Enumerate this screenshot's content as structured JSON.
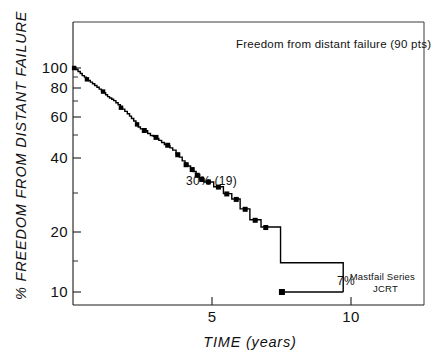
{
  "chart_data": {
    "type": "line",
    "title": "Freedom from distant failure (90 pts)",
    "xlabel": "TIME (years)",
    "ylabel": "% FREEDOM FROM DISTANT FAILURE",
    "xlim": [
      0,
      12.6
    ],
    "ylim": [
      8.2,
      125
    ],
    "yscale": "log",
    "grid": false,
    "legend": null,
    "xticks": [
      5,
      10
    ],
    "xtick_labels": [
      "5",
      "10"
    ],
    "yticks": [
      10,
      20,
      40,
      60,
      80,
      100
    ],
    "ytick_labels": [
      "10",
      "20",
      "40",
      "60",
      "80",
      "100"
    ],
    "yminor_ticks": [
      15,
      30,
      50,
      70,
      90
    ],
    "annotations": [
      {
        "text": "Freedom from distant failure (90 pts)",
        "x": 5.9,
        "y": 112
      },
      {
        "text": "30% (19)",
        "x": 4.95,
        "y": 33.5
      },
      {
        "text": "7%",
        "x": 9.45,
        "y": 10.6
      },
      {
        "text": "Mastfail Series",
        "x": 11.4,
        "y": 11.2
      },
      {
        "text": "JCRT",
        "x": 11.4,
        "y": 10.0
      }
    ],
    "series": [
      {
        "name": "Freedom from distant failure",
        "n_patients": 90,
        "curve_type": "kaplan-meier-step",
        "x": [
          0.0,
          0.1,
          0.18,
          0.26,
          0.33,
          0.41,
          0.48,
          0.55,
          0.62,
          0.7,
          0.78,
          0.86,
          0.94,
          1.02,
          1.1,
          1.17,
          1.24,
          1.31,
          1.39,
          1.46,
          1.54,
          1.62,
          1.7,
          1.78,
          1.86,
          1.95,
          2.03,
          2.1,
          2.18,
          2.26,
          2.34,
          2.42,
          2.5,
          2.58,
          2.68,
          2.78,
          2.88,
          2.98,
          3.08,
          3.18,
          3.28,
          3.38,
          3.48,
          3.58,
          3.7,
          3.82,
          3.92,
          4.02,
          4.12,
          4.22,
          4.32,
          4.42,
          4.55,
          4.7,
          5.05,
          5.4,
          5.7,
          6.0,
          6.35,
          6.75,
          7.45,
          9.7
        ],
        "y": [
          100.0,
          98.5,
          96.5,
          94.5,
          92.5,
          91.0,
          89.5,
          88.0,
          86.5,
          85.0,
          83.5,
          82.0,
          80.5,
          79.0,
          77.5,
          76.0,
          74.5,
          73.5,
          72.5,
          71.5,
          70.0,
          68.5,
          67.0,
          65.5,
          64.0,
          62.5,
          61.0,
          59.5,
          58.0,
          56.5,
          54.5,
          53.5,
          53.0,
          52.5,
          51.0,
          50.0,
          49.5,
          48.5,
          47.5,
          46.5,
          45.5,
          45.0,
          44.0,
          43.0,
          41.5,
          40.0,
          38.5,
          37.5,
          36.5,
          35.5,
          34.5,
          33.5,
          32.0,
          31.0,
          29.5,
          27.5,
          26.0,
          23.5,
          21.0,
          19.5,
          13.5,
          10.0
        ],
        "censor_marker": "square",
        "censor_points": [
          {
            "x": 0.04,
            "y": 100.0
          },
          {
            "x": 0.5,
            "y": 89.0
          },
          {
            "x": 1.08,
            "y": 78.5
          },
          {
            "x": 1.72,
            "y": 66.5
          },
          {
            "x": 2.3,
            "y": 56.0
          },
          {
            "x": 2.56,
            "y": 52.6
          },
          {
            "x": 2.98,
            "y": 49.0
          },
          {
            "x": 3.4,
            "y": 45.2
          },
          {
            "x": 3.76,
            "y": 41.0
          },
          {
            "x": 4.06,
            "y": 37.0
          },
          {
            "x": 4.28,
            "y": 35.2
          },
          {
            "x": 4.46,
            "y": 33.2
          },
          {
            "x": 4.62,
            "y": 31.8
          },
          {
            "x": 4.86,
            "y": 31.0
          },
          {
            "x": 5.22,
            "y": 29.4
          },
          {
            "x": 5.52,
            "y": 27.4
          },
          {
            "x": 5.86,
            "y": 25.9
          },
          {
            "x": 6.18,
            "y": 23.4
          },
          {
            "x": 6.54,
            "y": 20.9
          },
          {
            "x": 6.92,
            "y": 19.4
          },
          {
            "x": 7.5,
            "y": 10.0
          }
        ],
        "endpoint": {
          "x": 7.5,
          "y": 10.0,
          "label": "7%"
        },
        "milestone": {
          "x": 4.9,
          "y": 30,
          "label": "30% (19)",
          "n_at_risk": 19
        }
      }
    ]
  },
  "figure": {
    "y_axis_title": "% FREEDOM FROM DISTANT FAILURE",
    "x_axis_title": "TIME (years)",
    "header_note": "Freedom from distant failure (90 pts)",
    "milestone_note": "30% (19)",
    "endpoint_note": "7%",
    "source_line1": "Mastfail Series",
    "source_line2": "JCRT",
    "ytick_100": "100",
    "ytick_80": "80",
    "ytick_60": "60",
    "ytick_40": "40",
    "ytick_20": "20",
    "ytick_10": "10",
    "xtick_5": "5",
    "xtick_10": "10"
  },
  "colors": {
    "curve": "#000000",
    "axis": "#1a1a1a",
    "frame": "#3a3a3a",
    "text": "#111111",
    "background": "#ffffff"
  }
}
